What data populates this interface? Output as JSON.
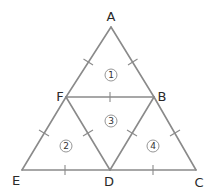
{
  "diagram": {
    "title": "",
    "vertices": {
      "A": {
        "label": "A",
        "x": 111,
        "y": 27
      },
      "F": {
        "label": "F",
        "x": 66,
        "y": 97
      },
      "B": {
        "label": "B",
        "x": 154,
        "y": 97
      },
      "E": {
        "label": "E",
        "x": 22,
        "y": 170
      },
      "D": {
        "label": "D",
        "x": 110,
        "y": 170
      },
      "C": {
        "label": "C",
        "x": 196,
        "y": 170
      }
    },
    "edges": [
      [
        "A",
        "F"
      ],
      [
        "A",
        "B"
      ],
      [
        "F",
        "B"
      ],
      [
        "F",
        "E"
      ],
      [
        "E",
        "D"
      ],
      [
        "F",
        "D"
      ],
      [
        "D",
        "B"
      ],
      [
        "D",
        "C"
      ],
      [
        "B",
        "C"
      ]
    ],
    "regions": [
      {
        "label": "1",
        "triangle": "AFB"
      },
      {
        "label": "2",
        "triangle": "FED"
      },
      {
        "label": "3",
        "triangle": "FDB"
      },
      {
        "label": "4",
        "triangle": "DCB"
      }
    ],
    "colors": {
      "line": "#8a8a8a",
      "text": "#2a2a2a",
      "background": "#ffffff"
    }
  }
}
